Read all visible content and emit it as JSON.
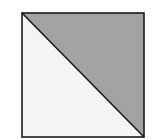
{
  "diagram": {
    "shape": "square-split-diagonally",
    "square": {
      "x": 22,
      "y": 13,
      "size": 122
    },
    "colors": {
      "shaded_triangle": "#a3a3a3",
      "unshaded_triangle": "#f4f4f4",
      "outline": "#1a1a1a"
    },
    "regions": [
      {
        "name": "upper-right triangle",
        "fill": "shaded"
      },
      {
        "name": "lower-left triangle",
        "fill": "unshaded"
      }
    ]
  }
}
